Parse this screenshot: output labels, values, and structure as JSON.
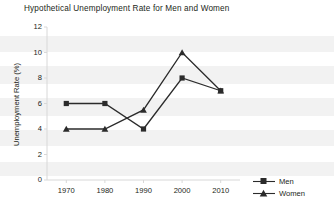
{
  "chart_data": {
    "type": "line",
    "title": "Hypothetical Unemployment Rate for Men and Women",
    "xlabel": "",
    "ylabel": "Unemployment Rate (%)",
    "x": [
      1970,
      1980,
      1990,
      2000,
      2010
    ],
    "xtick_labels": [
      "1970",
      "1980",
      "1990",
      "2000",
      "2010"
    ],
    "ytick_labels": [
      "0",
      "2",
      "4",
      "6",
      "8",
      "10",
      "12"
    ],
    "yticks": [
      0,
      2,
      4,
      6,
      8,
      10,
      12
    ],
    "ylim": [
      0,
      12
    ],
    "xlim": [
      1965,
      2015
    ],
    "grid": false,
    "legend_position": "outside-bottom-right",
    "series": [
      {
        "name": "Men",
        "marker": "square",
        "color": "#2b2b2b",
        "values": [
          6,
          6,
          4,
          8,
          7
        ]
      },
      {
        "name": "Women",
        "marker": "triangle",
        "color": "#2b2b2b",
        "values": [
          4,
          4,
          5.5,
          10,
          7
        ]
      }
    ]
  },
  "legend": {
    "items": [
      {
        "label": "Men"
      },
      {
        "label": "Women"
      }
    ]
  },
  "colors": {
    "ink": "#231f20",
    "series": "#2b2b2b",
    "axis": "#d8d8d8",
    "band": "#f2f2f2"
  }
}
